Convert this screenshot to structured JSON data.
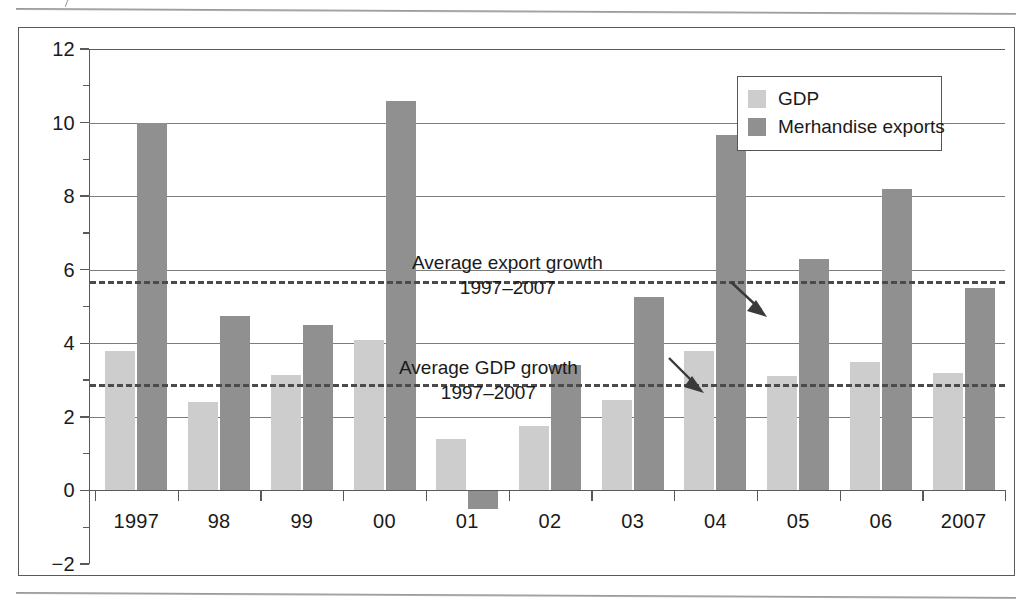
{
  "chart_data": {
    "type": "bar",
    "title": "",
    "subtitle": "",
    "xlabel": "",
    "ylabel": "",
    "categories": [
      "1997",
      "98",
      "99",
      "00",
      "01",
      "02",
      "03",
      "04",
      "05",
      "06",
      "2007"
    ],
    "series": [
      {
        "name": "GDP",
        "color": "#cdcdcd",
        "values": [
          3.8,
          2.4,
          3.15,
          4.1,
          1.4,
          1.75,
          2.45,
          3.8,
          3.1,
          3.5,
          3.2
        ]
      },
      {
        "name": "Merhandise exports",
        "color": "#909090",
        "values": [
          10.0,
          4.75,
          4.5,
          10.6,
          -0.5,
          3.4,
          5.25,
          9.65,
          6.3,
          8.2,
          5.5
        ]
      }
    ],
    "ylim": [
      -2,
      12
    ],
    "ytick_labels": [
      "12",
      "10",
      "8",
      "6",
      "4",
      "2",
      "0",
      "-2"
    ],
    "ytick_values": [
      12,
      10,
      8,
      6,
      4,
      2,
      0,
      -2
    ],
    "yminor_values": [
      11,
      9,
      7,
      5,
      3,
      1,
      -1
    ],
    "gridlines": [
      10,
      8,
      6,
      4,
      2,
      0
    ],
    "grid": true,
    "legend_position": "top-right",
    "reference_lines": [
      {
        "name": "average-export-growth",
        "value": 5.7,
        "style": "dashed",
        "label_line1": "Average export growth",
        "label_line2": "1997–2007"
      },
      {
        "name": "average-gdp-growth",
        "value": 2.9,
        "style": "dashed",
        "label_line1": "Average GDP growth",
        "label_line2": "1997–2007"
      }
    ]
  },
  "legend": {
    "items": [
      {
        "label": "GDP",
        "swatch": "gdp"
      },
      {
        "label": "Merhandise exports",
        "swatch": "exp"
      }
    ]
  },
  "annotations": {
    "export": {
      "line1": "Average export growth",
      "line2": "1997–2007"
    },
    "gdp": {
      "line1": "Average GDP growth",
      "line2": "1997–2007"
    }
  },
  "axes": {
    "y_ticks": [
      "12",
      "10",
      "8",
      "6",
      "4",
      "2",
      "0",
      "−2"
    ],
    "x_ticks": [
      "1997",
      "98",
      "99",
      "00",
      "01",
      "02",
      "03",
      "04",
      "05",
      "06",
      "2007"
    ]
  }
}
